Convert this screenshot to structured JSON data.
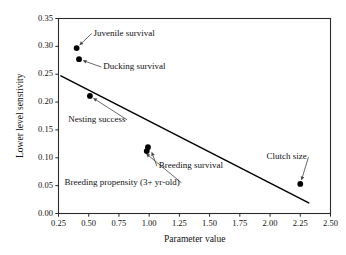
{
  "chart_data": {
    "type": "scatter",
    "title": "",
    "xlabel": "Parameter value",
    "ylabel": "Lower level senstivity",
    "xlim": [
      0.25,
      2.5
    ],
    "ylim": [
      0.0,
      0.35
    ],
    "xticks": [
      "0.25",
      "0.50",
      "0.75",
      "1.00",
      "1.25",
      "1.50",
      "1.75",
      "2.00",
      "2.25",
      "2.50"
    ],
    "xtick_values": [
      0.25,
      0.5,
      0.75,
      1.0,
      1.25,
      1.5,
      1.75,
      2.0,
      2.25,
      2.5
    ],
    "yticks": [
      "0.00",
      "0.05",
      "0.10",
      "0.15",
      "0.20",
      "0.25",
      "0.30",
      "0.35"
    ],
    "ytick_values": [
      0.0,
      0.05,
      0.1,
      0.15,
      0.2,
      0.25,
      0.3,
      0.35
    ],
    "grid": false,
    "legend": "none",
    "marker": "filled-circle",
    "marker_color": "#000000",
    "line_color": "#000000",
    "points": [
      {
        "label": "Juvenile survival",
        "x": 0.4,
        "y": 0.297
      },
      {
        "label": "Ducking survival",
        "x": 0.42,
        "y": 0.277
      },
      {
        "label": "Nesting success",
        "x": 0.51,
        "y": 0.211
      },
      {
        "label": "Breeding survival",
        "x": 0.99,
        "y": 0.119
      },
      {
        "label": "Breeding propensity (3+ yr-old)",
        "x": 0.98,
        "y": 0.112
      },
      {
        "label": "Clutch size",
        "x": 2.25,
        "y": 0.053
      }
    ],
    "trendline": {
      "type": "line",
      "x": [
        0.27,
        2.32
      ],
      "y": [
        0.247,
        0.019
      ]
    },
    "annotations": [
      {
        "text": "Juvenile survival",
        "text_x": 0.54,
        "text_y": 0.323,
        "point_x": 0.4,
        "point_y": 0.297,
        "arrow": true
      },
      {
        "text": "Ducking survival",
        "text_x": 0.62,
        "text_y": 0.263,
        "point_x": 0.42,
        "point_y": 0.277,
        "arrow": true
      },
      {
        "text": "Nesting success",
        "text_x": 0.33,
        "text_y": 0.168,
        "point_x": 0.51,
        "point_y": 0.211,
        "arrow": true
      },
      {
        "text": "Breeding survival",
        "text_x": 1.08,
        "text_y": 0.085,
        "point_x": 1.01,
        "point_y": 0.117,
        "arrow": true
      },
      {
        "text": "Breeding propensity (3+ yr-old)",
        "text_x": 0.3,
        "text_y": 0.055,
        "point_x": 0.95,
        "point_y": 0.112,
        "arrow": true
      },
      {
        "text": "Clutch size",
        "text_x": 1.97,
        "text_y": 0.101,
        "point_x": 2.25,
        "point_y": 0.053,
        "arrow": true
      }
    ]
  },
  "axes": {
    "x_title": "Parameter value",
    "y_title": "Lower level senstivity"
  }
}
